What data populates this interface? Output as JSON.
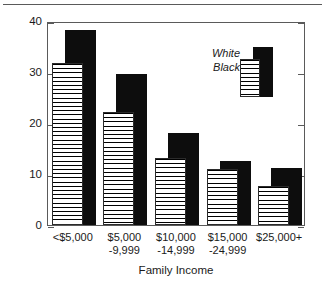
{
  "chart_data": {
    "type": "bar",
    "title": "",
    "subtitle": "",
    "xlabel": "Family Income",
    "ylabel": "Percent with Limitations",
    "categories": [
      "<$5,000",
      "$5,000\n-9,999",
      "$10,000\n-14,999",
      "$15,000\n-24,999",
      "$25,000+"
    ],
    "category_lines": [
      {
        "line1": "<$5,000",
        "line2": ""
      },
      {
        "line1": "$5,000",
        "line2": "-9,999"
      },
      {
        "line1": "$10,000",
        "line2": "-14,999"
      },
      {
        "line1": "$15,000",
        "line2": "-24,999"
      },
      {
        "line1": "$25,000+",
        "line2": ""
      }
    ],
    "series": [
      {
        "name": "White",
        "values": [
          31.8,
          22.2,
          13.1,
          11.0,
          7.7
        ],
        "fill": "horizontal-hatch"
      },
      {
        "name": "Black",
        "values": [
          38.2,
          29.6,
          18.0,
          12.5,
          11.2
        ],
        "fill": "solid-black"
      }
    ],
    "ylim": [
      0,
      40
    ],
    "yticks": [
      0,
      10,
      20,
      30,
      40
    ],
    "ytick_labels": [
      "0",
      "10",
      "20",
      "30",
      "40"
    ],
    "grid": false,
    "legend_position": "top-right",
    "frame": "full-box",
    "tick_direction": "in",
    "colors": {
      "axis": "#5a5a5a",
      "text": "#1a1a1a",
      "black_series": "#0d0d0d",
      "white_series": "#ffffff",
      "hatch_line": "#000000"
    }
  },
  "legend": {
    "entries": [
      {
        "label": "White"
      },
      {
        "label": "Black"
      }
    ]
  },
  "axes": {
    "y_title": "Percent with Limitations",
    "x_title": "Family Income",
    "y_ticks": [
      "40",
      "30",
      "20",
      "10",
      "0"
    ]
  }
}
